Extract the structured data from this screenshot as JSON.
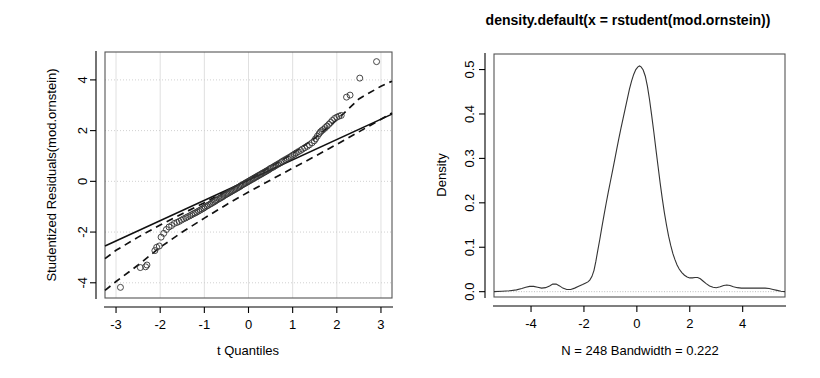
{
  "figure": {
    "width": 820,
    "height": 378,
    "background": "#ffffff",
    "panels": 2
  },
  "chart_data": [
    {
      "id": "qq-plot",
      "type": "scatter",
      "title": "",
      "xlabel": "t Quantiles",
      "ylabel": "Studentized Residuals(mod.ornstein)",
      "xlim": [
        -3.25,
        3.25
      ],
      "ylim": [
        -4.6,
        5.1
      ],
      "xticks": [
        -3,
        -2,
        -1,
        0,
        1,
        2,
        3
      ],
      "xticklabels": [
        "-3",
        "-2",
        "-1",
        "0",
        "1",
        "2",
        "3"
      ],
      "yticks": [
        -4,
        -2,
        0,
        2,
        4
      ],
      "yticklabels": [
        "-4",
        "-2",
        "0",
        "2",
        "4"
      ],
      "grid": true,
      "n_points": 248,
      "reference_line": {
        "style": "solid",
        "slope": 0.8,
        "intercept": 0.05,
        "x_start": -3.25,
        "x_end": 3.25
      },
      "confidence_envelope": {
        "style": "dashed",
        "upper": [
          [
            -3.25,
            -3.05
          ],
          [
            -3.0,
            -2.72
          ],
          [
            -2.5,
            -2.2
          ],
          [
            -2.0,
            -1.72
          ],
          [
            -1.5,
            -1.28
          ],
          [
            -1.0,
            -0.84
          ],
          [
            -0.5,
            -0.39
          ],
          [
            0.0,
            0.08
          ],
          [
            0.5,
            0.57
          ],
          [
            1.0,
            1.1
          ],
          [
            1.5,
            1.7
          ],
          [
            2.0,
            2.42
          ],
          [
            2.5,
            3.25
          ],
          [
            3.0,
            3.75
          ],
          [
            3.25,
            3.95
          ]
        ],
        "lower": [
          [
            -3.25,
            -4.3
          ],
          [
            -3.0,
            -3.95
          ],
          [
            -2.5,
            -3.3
          ],
          [
            -2.0,
            -2.6
          ],
          [
            -1.5,
            -2.0
          ],
          [
            -1.0,
            -1.45
          ],
          [
            -0.5,
            -0.92
          ],
          [
            0.0,
            -0.42
          ],
          [
            0.5,
            0.05
          ],
          [
            1.0,
            0.52
          ],
          [
            1.5,
            0.98
          ],
          [
            2.0,
            1.46
          ],
          [
            2.5,
            1.95
          ],
          [
            3.0,
            2.45
          ],
          [
            3.25,
            2.7
          ]
        ]
      },
      "points": [
        [
          -2.9,
          -4.18
        ],
        [
          -2.45,
          -3.4
        ],
        [
          -2.33,
          -3.37
        ],
        [
          -2.3,
          -3.3
        ],
        [
          -2.12,
          -2.73
        ],
        [
          -2.08,
          -2.6
        ],
        [
          -2.02,
          -2.55
        ],
        [
          -1.98,
          -2.2
        ],
        [
          -1.92,
          -2.05
        ],
        [
          -1.86,
          -1.9
        ],
        [
          -1.8,
          -1.8
        ],
        [
          -1.74,
          -1.74
        ],
        [
          -1.68,
          -1.66
        ],
        [
          -1.62,
          -1.62
        ],
        [
          -1.57,
          -1.58
        ],
        [
          -1.52,
          -1.53
        ],
        [
          -1.47,
          -1.48
        ],
        [
          -1.42,
          -1.44
        ],
        [
          -1.38,
          -1.4
        ],
        [
          -1.33,
          -1.36
        ],
        [
          -1.29,
          -1.32
        ],
        [
          -1.25,
          -1.28
        ],
        [
          -1.21,
          -1.25
        ],
        [
          -1.17,
          -1.21
        ],
        [
          -1.13,
          -1.17
        ],
        [
          -1.09,
          -1.13
        ],
        [
          -1.05,
          -1.09
        ],
        [
          -1.01,
          -1.05
        ],
        [
          -0.98,
          -1.01
        ],
        [
          -0.94,
          -0.97
        ],
        [
          -0.91,
          -0.94
        ],
        [
          -0.87,
          -0.9
        ],
        [
          -0.84,
          -0.87
        ],
        [
          -0.8,
          -0.83
        ],
        [
          -0.77,
          -0.8
        ],
        [
          -0.74,
          -0.76
        ],
        [
          -0.71,
          -0.73
        ],
        [
          -0.67,
          -0.69
        ],
        [
          -0.64,
          -0.66
        ],
        [
          -0.61,
          -0.63
        ],
        [
          -0.58,
          -0.6
        ],
        [
          -0.55,
          -0.56
        ],
        [
          -0.52,
          -0.53
        ],
        [
          -0.49,
          -0.5
        ],
        [
          -0.46,
          -0.47
        ],
        [
          -0.43,
          -0.44
        ],
        [
          -0.4,
          -0.41
        ],
        [
          -0.37,
          -0.38
        ],
        [
          -0.34,
          -0.35
        ],
        [
          -0.31,
          -0.32
        ],
        [
          -0.28,
          -0.29
        ],
        [
          -0.25,
          -0.26
        ],
        [
          -0.22,
          -0.23
        ],
        [
          -0.19,
          -0.2
        ],
        [
          -0.17,
          -0.17
        ],
        [
          -0.14,
          -0.14
        ],
        [
          -0.11,
          -0.11
        ],
        [
          -0.08,
          -0.08
        ],
        [
          -0.05,
          -0.05
        ],
        [
          -0.02,
          -0.02
        ],
        [
          0.01,
          0.01
        ],
        [
          0.04,
          0.04
        ],
        [
          0.07,
          0.07
        ],
        [
          0.1,
          0.1
        ],
        [
          0.13,
          0.13
        ],
        [
          0.16,
          0.16
        ],
        [
          0.19,
          0.19
        ],
        [
          0.22,
          0.22
        ],
        [
          0.25,
          0.25
        ],
        [
          0.28,
          0.28
        ],
        [
          0.31,
          0.31
        ],
        [
          0.34,
          0.34
        ],
        [
          0.37,
          0.37
        ],
        [
          0.4,
          0.4
        ],
        [
          0.43,
          0.43
        ],
        [
          0.46,
          0.46
        ],
        [
          0.49,
          0.5
        ],
        [
          0.52,
          0.53
        ],
        [
          0.56,
          0.56
        ],
        [
          0.59,
          0.6
        ],
        [
          0.62,
          0.63
        ],
        [
          0.66,
          0.67
        ],
        [
          0.69,
          0.7
        ],
        [
          0.73,
          0.74
        ],
        [
          0.76,
          0.78
        ],
        [
          0.8,
          0.82
        ],
        [
          0.84,
          0.86
        ],
        [
          0.88,
          0.9
        ],
        [
          0.92,
          0.94
        ],
        [
          0.96,
          0.98
        ],
        [
          1.0,
          1.03
        ],
        [
          1.04,
          1.07
        ],
        [
          1.08,
          1.12
        ],
        [
          1.13,
          1.17
        ],
        [
          1.18,
          1.22
        ],
        [
          1.22,
          1.27
        ],
        [
          1.27,
          1.32
        ],
        [
          1.33,
          1.38
        ],
        [
          1.38,
          1.44
        ],
        [
          1.44,
          1.52
        ],
        [
          1.49,
          1.6
        ],
        [
          1.52,
          1.68
        ],
        [
          1.56,
          1.78
        ],
        [
          1.6,
          1.88
        ],
        [
          1.63,
          1.95
        ],
        [
          1.66,
          2.0
        ],
        [
          1.7,
          2.05
        ],
        [
          1.74,
          2.12
        ],
        [
          1.78,
          2.18
        ],
        [
          1.82,
          2.25
        ],
        [
          1.86,
          2.32
        ],
        [
          1.9,
          2.4
        ],
        [
          1.95,
          2.48
        ],
        [
          2.0,
          2.53
        ],
        [
          2.05,
          2.57
        ],
        [
          2.1,
          2.6
        ],
        [
          2.22,
          3.32
        ],
        [
          2.3,
          3.4
        ],
        [
          2.52,
          4.07
        ],
        [
          2.9,
          4.72
        ]
      ]
    },
    {
      "id": "density-plot",
      "type": "line",
      "title": "density.default(x = rstudent(mod.ornstein))",
      "xlabel": "N = 248   Bandwidth = 0.222",
      "ylabel": "Density",
      "xlim": [
        -5.4,
        5.6
      ],
      "ylim": [
        -0.012,
        0.535
      ],
      "xticks": [
        -4,
        -2,
        0,
        2,
        4
      ],
      "xticklabels": [
        "-4",
        "-2",
        "0",
        "2",
        "4"
      ],
      "yticks": [
        0.0,
        0.1,
        0.2,
        0.3,
        0.4,
        0.5
      ],
      "yticklabels": [
        "0.0",
        "0.1",
        "0.2",
        "0.3",
        "0.4",
        "0.5"
      ],
      "grid": false,
      "n": 248,
      "bandwidth": 0.222,
      "peak": {
        "x": 0.1,
        "y": 0.508
      },
      "curve": [
        [
          -5.4,
          0.0
        ],
        [
          -5.1,
          0.001
        ],
        [
          -4.8,
          0.002
        ],
        [
          -4.55,
          0.004
        ],
        [
          -4.35,
          0.007
        ],
        [
          -4.2,
          0.01
        ],
        [
          -4.05,
          0.012
        ],
        [
          -3.9,
          0.012
        ],
        [
          -3.75,
          0.01
        ],
        [
          -3.6,
          0.008
        ],
        [
          -3.45,
          0.009
        ],
        [
          -3.3,
          0.013
        ],
        [
          -3.18,
          0.017
        ],
        [
          -3.05,
          0.017
        ],
        [
          -2.92,
          0.013
        ],
        [
          -2.8,
          0.008
        ],
        [
          -2.65,
          0.005
        ],
        [
          -2.5,
          0.005
        ],
        [
          -2.35,
          0.008
        ],
        [
          -2.2,
          0.012
        ],
        [
          -2.05,
          0.016
        ],
        [
          -1.95,
          0.019
        ],
        [
          -1.85,
          0.022
        ],
        [
          -1.78,
          0.026
        ],
        [
          -1.7,
          0.034
        ],
        [
          -1.62,
          0.048
        ],
        [
          -1.55,
          0.068
        ],
        [
          -1.48,
          0.092
        ],
        [
          -1.4,
          0.118
        ],
        [
          -1.32,
          0.146
        ],
        [
          -1.24,
          0.173
        ],
        [
          -1.16,
          0.199
        ],
        [
          -1.08,
          0.224
        ],
        [
          -1.0,
          0.248
        ],
        [
          -0.92,
          0.272
        ],
        [
          -0.84,
          0.296
        ],
        [
          -0.76,
          0.321
        ],
        [
          -0.68,
          0.345
        ],
        [
          -0.6,
          0.368
        ],
        [
          -0.52,
          0.39
        ],
        [
          -0.44,
          0.412
        ],
        [
          -0.36,
          0.434
        ],
        [
          -0.28,
          0.456
        ],
        [
          -0.2,
          0.474
        ],
        [
          -0.12,
          0.489
        ],
        [
          -0.04,
          0.5
        ],
        [
          0.04,
          0.506
        ],
        [
          0.1,
          0.508
        ],
        [
          0.16,
          0.506
        ],
        [
          0.24,
          0.499
        ],
        [
          0.32,
          0.485
        ],
        [
          0.4,
          0.462
        ],
        [
          0.48,
          0.432
        ],
        [
          0.56,
          0.397
        ],
        [
          0.64,
          0.36
        ],
        [
          0.72,
          0.321
        ],
        [
          0.8,
          0.283
        ],
        [
          0.88,
          0.245
        ],
        [
          0.96,
          0.21
        ],
        [
          1.04,
          0.178
        ],
        [
          1.12,
          0.15
        ],
        [
          1.2,
          0.125
        ],
        [
          1.28,
          0.104
        ],
        [
          1.36,
          0.086
        ],
        [
          1.44,
          0.072
        ],
        [
          1.52,
          0.06
        ],
        [
          1.6,
          0.051
        ],
        [
          1.7,
          0.043
        ],
        [
          1.8,
          0.037
        ],
        [
          1.9,
          0.033
        ],
        [
          2.0,
          0.031
        ],
        [
          2.1,
          0.031
        ],
        [
          2.2,
          0.032
        ],
        [
          2.3,
          0.032
        ],
        [
          2.4,
          0.029
        ],
        [
          2.5,
          0.024
        ],
        [
          2.62,
          0.018
        ],
        [
          2.75,
          0.013
        ],
        [
          2.88,
          0.01
        ],
        [
          3.0,
          0.009
        ],
        [
          3.15,
          0.011
        ],
        [
          3.28,
          0.014
        ],
        [
          3.4,
          0.015
        ],
        [
          3.52,
          0.014
        ],
        [
          3.65,
          0.011
        ],
        [
          3.8,
          0.009
        ],
        [
          3.95,
          0.008
        ],
        [
          4.1,
          0.008
        ],
        [
          4.25,
          0.008
        ],
        [
          4.4,
          0.008
        ],
        [
          4.55,
          0.008
        ],
        [
          4.7,
          0.008
        ],
        [
          4.85,
          0.008
        ],
        [
          5.0,
          0.007
        ],
        [
          5.15,
          0.005
        ],
        [
          5.3,
          0.003
        ],
        [
          5.45,
          0.001
        ],
        [
          5.6,
          0.0
        ]
      ]
    }
  ],
  "colors": {
    "ink": "#000000",
    "box": "#555555",
    "grid": "#d8d8d8",
    "curve": "#333333",
    "baseline": "#b5b5b5"
  }
}
